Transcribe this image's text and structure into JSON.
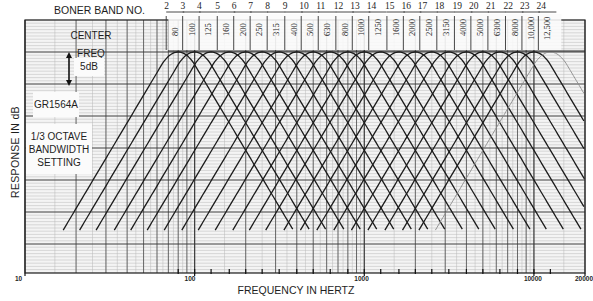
{
  "chart_data": {
    "type": "line",
    "title": "",
    "xlabel": "FREQUENCY IN HERTZ",
    "ylabel": "RESPONSE IN dB",
    "x_scale": "log",
    "xlim": [
      10,
      20000
    ],
    "x_tick_labels": [
      "10",
      "100",
      "1000",
      "10000",
      "20000"
    ],
    "x_ticks": [
      10,
      100,
      1000,
      10000,
      20000
    ],
    "y_scale_annotation": "5dB",
    "grid": true,
    "band_header_label": "BONER BAND NO.",
    "center_freq_label": "CENTER FREQ",
    "instrument_label": "GR1564A",
    "setting_label": "1/3 OCTAVE BANDWIDTH SETTING",
    "setting_lines": [
      "1/3 OCTAVE",
      "BANDWIDTH",
      "SETTING"
    ],
    "bands": [
      {
        "band": "2",
        "center_freq": "80",
        "hz": 80
      },
      {
        "band": "3",
        "center_freq": "100",
        "hz": 100
      },
      {
        "band": "4",
        "center_freq": "125",
        "hz": 125
      },
      {
        "band": "5",
        "center_freq": "160",
        "hz": 160
      },
      {
        "band": "6",
        "center_freq": "200",
        "hz": 200
      },
      {
        "band": "7",
        "center_freq": "250",
        "hz": 250
      },
      {
        "band": "8",
        "center_freq": "315",
        "hz": 315
      },
      {
        "band": "9",
        "center_freq": "400",
        "hz": 400
      },
      {
        "band": "10",
        "center_freq": "500",
        "hz": 500
      },
      {
        "band": "11",
        "center_freq": "630",
        "hz": 630
      },
      {
        "band": "12",
        "center_freq": "800",
        "hz": 800
      },
      {
        "band": "13",
        "center_freq": "1000",
        "hz": 1000
      },
      {
        "band": "14",
        "center_freq": "1250",
        "hz": 1250
      },
      {
        "band": "15",
        "center_freq": "1600",
        "hz": 1600
      },
      {
        "band": "16",
        "center_freq": "2000",
        "hz": 2000
      },
      {
        "band": "17",
        "center_freq": "2500",
        "hz": 2500
      },
      {
        "band": "18",
        "center_freq": "3150",
        "hz": 3150
      },
      {
        "band": "19",
        "center_freq": "4000",
        "hz": 4000
      },
      {
        "band": "20",
        "center_freq": "5000",
        "hz": 5000
      },
      {
        "band": "21",
        "center_freq": "6300",
        "hz": 6300
      },
      {
        "band": "22",
        "center_freq": "8000",
        "hz": 8000
      },
      {
        "band": "23",
        "center_freq": "10,000",
        "hz": 10000
      },
      {
        "band": "24",
        "center_freq": "12,500",
        "hz": 12500
      }
    ],
    "series_description": "One bell-shaped filter response curve per 1/3-octave band, peaking at 0 dB at each band center frequency and falling steeply on both sides; adjacent curves cross forming a diamond lattice."
  },
  "labels": {
    "band_header": "BONER BAND NO.",
    "center_freq": "CENTER FREQ",
    "scale": "5dB",
    "instrument": "GR1564A",
    "setting_1": "1/3 OCTAVE",
    "setting_2": "BANDWIDTH",
    "setting_3": "SETTING",
    "ylabel": "RESPONSE IN dB",
    "xlabel": "FREQUENCY IN HERTZ"
  },
  "colors": {
    "paper": "#f4f4f4",
    "grid_minor": "#b9b9b9",
    "grid_major": "#3a3a3a",
    "curve": "#1c1c1c",
    "curve_faint": "#8a8a8a"
  }
}
